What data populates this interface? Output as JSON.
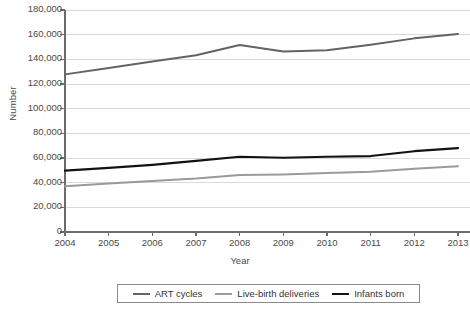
{
  "chart_data": {
    "type": "line",
    "title": "",
    "xlabel": "Year",
    "ylabel": "Number",
    "grid": true,
    "legend_position": "bottom",
    "x": [
      2004,
      2005,
      2006,
      2007,
      2008,
      2009,
      2010,
      2011,
      2012,
      2013
    ],
    "xtick_labels": [
      "2004",
      "2005",
      "2006",
      "2007",
      "2008",
      "2009",
      "2010",
      "2011",
      "2012",
      "2013"
    ],
    "ylim": [
      0,
      180000
    ],
    "ytick_labels": [
      "180,000",
      "160,000",
      "140,000",
      "120,000",
      "100,000",
      "80,000",
      "60,000",
      "40,000",
      "20,000",
      "0"
    ],
    "ytick_values": [
      180000,
      160000,
      140000,
      120000,
      100000,
      80000,
      60000,
      40000,
      20000,
      0
    ],
    "series": [
      {
        "name": "ART cycles",
        "color": "#636363",
        "width": 2.0,
        "values": [
          127800,
          133000,
          138200,
          143300,
          151600,
          146300,
          147300,
          151900,
          157000,
          160500
        ]
      },
      {
        "name": "Live-birth deliveries",
        "color": "#9a9a9a",
        "width": 2.0,
        "values": [
          37000,
          39400,
          41300,
          43400,
          46300,
          46700,
          47800,
          48900,
          51300,
          53300
        ]
      },
      {
        "name": "Infants born",
        "color": "#121212",
        "width": 2.2,
        "values": [
          49700,
          52000,
          54500,
          57600,
          61000,
          60200,
          61000,
          61600,
          65500,
          68000
        ]
      }
    ]
  },
  "legend": {
    "items": [
      {
        "label": "ART cycles",
        "color": "#636363",
        "thickness": "2px"
      },
      {
        "label": "Live-birth deliveries",
        "color": "#9a9a9a",
        "thickness": "2px"
      },
      {
        "label": "Infants born",
        "color": "#121212",
        "thickness": "2.5px"
      }
    ]
  },
  "axes": {
    "y_title": "Number",
    "x_title": "Year",
    "axis_color": "#6b6b6b",
    "grid_color": "#d9d9d9"
  }
}
